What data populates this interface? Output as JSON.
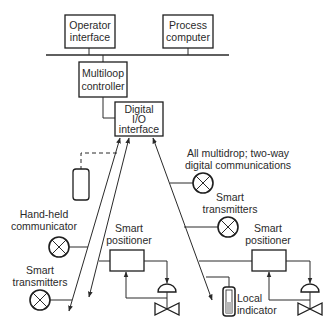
{
  "diagram": {
    "colors": {
      "line": "#2a2a2a",
      "box_fill": "#ffffff",
      "indicator_fill": "#b8b8b8",
      "text": "#2a2a2a"
    },
    "nodes": {
      "operator_interface": {
        "line1": "Operator",
        "line2": "interface"
      },
      "process_computer": {
        "line1": "Process",
        "line2": "computer"
      },
      "multiloop_controller": {
        "line1": "Multiloop",
        "line2": "controller"
      },
      "digital_io": {
        "line1": "Digital",
        "line2": "I/O",
        "line3": "interface"
      },
      "hand_held": {
        "line1": "Hand-held",
        "line2": "communicator"
      },
      "smart_transmitters_left": {
        "line1": "Smart",
        "line2": "transmitters"
      },
      "smart_transmitters_right": {
        "line1": "Smart",
        "line2": "transmitters"
      },
      "smart_positioner_left": {
        "line1": "Smart",
        "line2": "positioner"
      },
      "smart_positioner_right": {
        "line1": "Smart",
        "line2": "positioner"
      },
      "local_indicator": {
        "line1": "Local",
        "line2": "indicator"
      }
    },
    "annotation": {
      "line1": "All multidrop; two-way",
      "line2": "digital communications"
    },
    "icons": [
      "transmitter-icon",
      "control-valve-icon",
      "hand-held-communicator-icon",
      "local-indicator-icon",
      "arrow-icon"
    ]
  }
}
